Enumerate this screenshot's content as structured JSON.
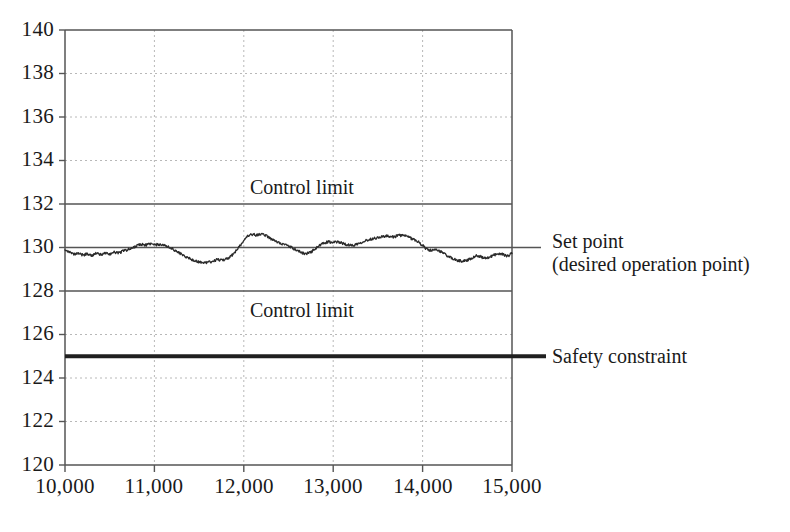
{
  "chart_data": {
    "type": "line",
    "title": "",
    "subtitle": "",
    "xlabel": "",
    "ylabel": "",
    "xlim": [
      10000,
      15000
    ],
    "ylim": [
      120,
      140
    ],
    "grid": true,
    "legend_position": "right-outside",
    "x_ticks": [
      {
        "value": 10000,
        "label": "10,000"
      },
      {
        "value": 11000,
        "label": "11,000"
      },
      {
        "value": 12000,
        "label": "12,000"
      },
      {
        "value": 13000,
        "label": "13,000"
      },
      {
        "value": 14000,
        "label": "14,000"
      },
      {
        "value": 15000,
        "label": "15,000"
      }
    ],
    "y_ticks": [
      {
        "value": 120,
        "label": "120"
      },
      {
        "value": 122,
        "label": "122"
      },
      {
        "value": 124,
        "label": "124"
      },
      {
        "value": 126,
        "label": "126"
      },
      {
        "value": 128,
        "label": "128"
      },
      {
        "value": 130,
        "label": "130"
      },
      {
        "value": 132,
        "label": "132"
      },
      {
        "value": 134,
        "label": "134"
      },
      {
        "value": 136,
        "label": "136"
      },
      {
        "value": 138,
        "label": "138"
      },
      {
        "value": 140,
        "label": "140"
      }
    ],
    "reference_lines": [
      {
        "name": "upper-control-limit",
        "value": 132,
        "label": "Control limit",
        "label_position": "above-line-inside",
        "style": "solid",
        "width": 1.6,
        "color": "#555555"
      },
      {
        "name": "set-point",
        "value": 130,
        "label": "Set point",
        "label2": "(desired operation point)",
        "label_position": "right-outside",
        "style": "solid",
        "width": 1.6,
        "color": "#555555"
      },
      {
        "name": "lower-control-limit",
        "value": 128,
        "label": "Control limit",
        "label_position": "below-line-inside",
        "style": "solid",
        "width": 1.6,
        "color": "#555555"
      },
      {
        "name": "safety-constraint",
        "value": 125,
        "label": "Safety constraint",
        "label_position": "right-outside",
        "style": "solid",
        "width": 4.0,
        "color": "#202020"
      }
    ],
    "series": [
      {
        "name": "process-variable",
        "color": "#2b2b2b",
        "width": 1.3,
        "noise_amplitude": 0.06,
        "x": [
          10000,
          10050,
          10100,
          10150,
          10200,
          10250,
          10300,
          10350,
          10400,
          10450,
          10500,
          10550,
          10600,
          10650,
          10700,
          10750,
          10800,
          10850,
          10900,
          10950,
          11000,
          11050,
          11100,
          11150,
          11200,
          11250,
          11300,
          11350,
          11400,
          11450,
          11500,
          11550,
          11600,
          11650,
          11700,
          11750,
          11800,
          11850,
          11900,
          11950,
          12000,
          12050,
          12100,
          12150,
          12200,
          12250,
          12300,
          12350,
          12400,
          12450,
          12500,
          12550,
          12600,
          12650,
          12700,
          12750,
          12800,
          12850,
          12900,
          12950,
          13000,
          13050,
          13100,
          13150,
          13200,
          13250,
          13300,
          13350,
          13400,
          13450,
          13500,
          13550,
          13600,
          13650,
          13700,
          13750,
          13800,
          13850,
          13900,
          13950,
          14000,
          14050,
          14100,
          14150,
          14200,
          14250,
          14300,
          14350,
          14400,
          14450,
          14500,
          14550,
          14600,
          14650,
          14700,
          14750,
          14800,
          14850,
          14900,
          14950,
          15000
        ],
        "y": [
          129.92,
          129.78,
          129.68,
          129.72,
          129.66,
          129.7,
          129.64,
          129.72,
          129.68,
          129.74,
          129.7,
          129.78,
          129.76,
          129.84,
          129.9,
          129.96,
          130.08,
          130.14,
          130.12,
          130.16,
          130.12,
          130.14,
          130.1,
          130.04,
          129.94,
          129.82,
          129.7,
          129.58,
          129.48,
          129.4,
          129.34,
          129.3,
          129.32,
          129.36,
          129.44,
          129.42,
          129.48,
          129.58,
          129.78,
          130.04,
          130.32,
          130.52,
          130.6,
          130.56,
          130.62,
          130.54,
          130.4,
          130.3,
          130.22,
          130.14,
          130.06,
          129.96,
          129.86,
          129.76,
          129.72,
          129.8,
          129.94,
          130.1,
          130.2,
          130.26,
          130.22,
          130.26,
          130.2,
          130.14,
          130.1,
          130.14,
          130.22,
          130.3,
          130.36,
          130.42,
          130.46,
          130.5,
          130.52,
          130.48,
          130.52,
          130.56,
          130.54,
          130.46,
          130.38,
          130.26,
          130.1,
          129.92,
          129.86,
          129.88,
          129.82,
          129.7,
          129.56,
          129.46,
          129.4,
          129.38,
          129.42,
          129.52,
          129.62,
          129.58,
          129.5,
          129.56,
          129.66,
          129.72,
          129.68,
          129.62,
          129.72
        ]
      }
    ]
  },
  "axes": {
    "frame_color": "#555555",
    "gridline_color": "#b8b8b8",
    "gridline_style": "dotted"
  }
}
